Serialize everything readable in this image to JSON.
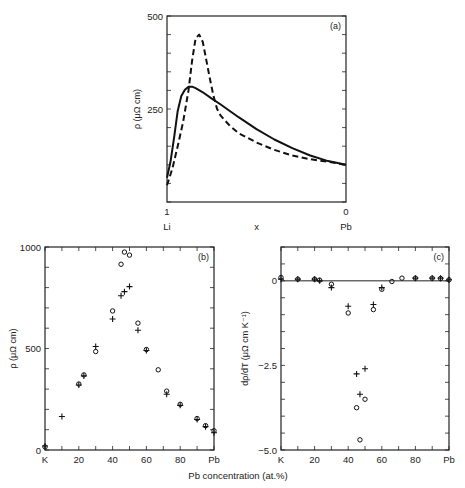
{
  "figure": {
    "xlabel_shared": "Pb concentration (at.%)"
  },
  "chart_data": [
    {
      "id": "a",
      "panel_label": "(a)",
      "type": "line",
      "title": "",
      "xlabel": "x",
      "ylabel": "ρ (μΩ cm)",
      "xlim": [
        1,
        0
      ],
      "ylim": [
        0,
        500
      ],
      "x_tick_labels": [
        {
          "v": 1,
          "label": "1",
          "sub": "Li"
        },
        {
          "v": 0,
          "label": "0",
          "sub": "Pb"
        }
      ],
      "y_ticks": [
        250,
        500
      ],
      "y_minor_step": 50,
      "grid": false,
      "series": [
        {
          "name": "solid",
          "style": "solid",
          "x": [
            1.0,
            0.98,
            0.96,
            0.94,
            0.92,
            0.9,
            0.88,
            0.86,
            0.84,
            0.8,
            0.75,
            0.7,
            0.6,
            0.5,
            0.4,
            0.3,
            0.2,
            0.1,
            0.0
          ],
          "y": [
            65,
            110,
            175,
            245,
            285,
            302,
            310,
            310,
            306,
            295,
            278,
            262,
            228,
            196,
            168,
            145,
            125,
            110,
            100
          ]
        },
        {
          "name": "dashed",
          "style": "dashed",
          "x": [
            1.0,
            0.97,
            0.94,
            0.91,
            0.88,
            0.86,
            0.84,
            0.82,
            0.8,
            0.78,
            0.76,
            0.74,
            0.72,
            0.7,
            0.65,
            0.6,
            0.5,
            0.4,
            0.3,
            0.2,
            0.1,
            0.0
          ],
          "y": [
            45,
            90,
            150,
            215,
            300,
            380,
            440,
            450,
            430,
            380,
            330,
            285,
            250,
            232,
            205,
            185,
            160,
            140,
            125,
            115,
            108,
            100
          ]
        }
      ]
    },
    {
      "id": "b",
      "panel_label": "(b)",
      "type": "scatter",
      "xlabel": "",
      "ylabel": "ρ (μΩ cm)",
      "xlim": [
        0,
        100
      ],
      "ylim": [
        0,
        1000
      ],
      "x_tick_labels": [
        {
          "v": 0,
          "label": "K"
        },
        {
          "v": 20,
          "label": "20"
        },
        {
          "v": 40,
          "label": "40"
        },
        {
          "v": 60,
          "label": "60"
        },
        {
          "v": 80,
          "label": "80"
        },
        {
          "v": 100,
          "label": "Pb"
        }
      ],
      "y_ticks": [
        0,
        500,
        1000
      ],
      "y_minor_step": 100,
      "x_minor_step": 10,
      "grid": false,
      "series": [
        {
          "name": "circles",
          "marker": "o",
          "x": [
            0,
            20,
            23,
            30,
            40,
            45,
            47,
            50,
            55,
            60,
            67,
            72,
            80,
            90,
            95,
            100
          ],
          "y": [
            15,
            325,
            370,
            485,
            685,
            915,
            975,
            960,
            625,
            495,
            395,
            290,
            225,
            155,
            120,
            95
          ]
        },
        {
          "name": "crosses",
          "marker": "+",
          "x": [
            0,
            10,
            20,
            23,
            30,
            40,
            45,
            47,
            50,
            55,
            60,
            72,
            80,
            90,
            95,
            100
          ],
          "y": [
            20,
            165,
            320,
            365,
            510,
            645,
            760,
            780,
            805,
            590,
            490,
            275,
            220,
            150,
            115,
            85
          ]
        }
      ]
    },
    {
      "id": "c",
      "panel_label": "(c)",
      "type": "scatter",
      "xlabel": "",
      "ylabel": "dρ/dT (μΩ cm K⁻¹)",
      "xlim": [
        0,
        100
      ],
      "ylim": [
        -5.0,
        1.0
      ],
      "x_tick_labels": [
        {
          "v": 0,
          "label": "K"
        },
        {
          "v": 20,
          "label": "20"
        },
        {
          "v": 40,
          "label": "40"
        },
        {
          "v": 60,
          "label": "60"
        },
        {
          "v": 80,
          "label": "80"
        },
        {
          "v": 100,
          "label": "Pb"
        }
      ],
      "y_ticks": [
        0,
        -2.5,
        -5.0
      ],
      "y_tick_labels": [
        "0",
        "−2.5",
        "−5.0"
      ],
      "y_minor_step": 0.5,
      "x_minor_step": 10,
      "zero_line": true,
      "grid": false,
      "series": [
        {
          "name": "circles",
          "marker": "o",
          "x": [
            0,
            10,
            20,
            23,
            30,
            40,
            45,
            47,
            50,
            55,
            60,
            66,
            72,
            80,
            90,
            95,
            100
          ],
          "y": [
            0.1,
            0.05,
            0.05,
            0.02,
            -0.1,
            -0.95,
            -3.75,
            -4.7,
            -3.5,
            -0.85,
            -0.25,
            -0.02,
            0.08,
            0.08,
            0.08,
            0.07,
            0.03
          ]
        },
        {
          "name": "crosses",
          "marker": "+",
          "x": [
            0,
            10,
            20,
            23,
            30,
            40,
            45,
            47,
            50,
            55,
            60,
            80,
            90,
            95,
            100
          ],
          "y": [
            0.05,
            0.05,
            0.05,
            0.0,
            -0.2,
            -0.75,
            -2.75,
            -3.35,
            -2.6,
            -0.7,
            -0.2,
            0.08,
            0.08,
            0.08,
            0.03
          ]
        }
      ]
    }
  ]
}
